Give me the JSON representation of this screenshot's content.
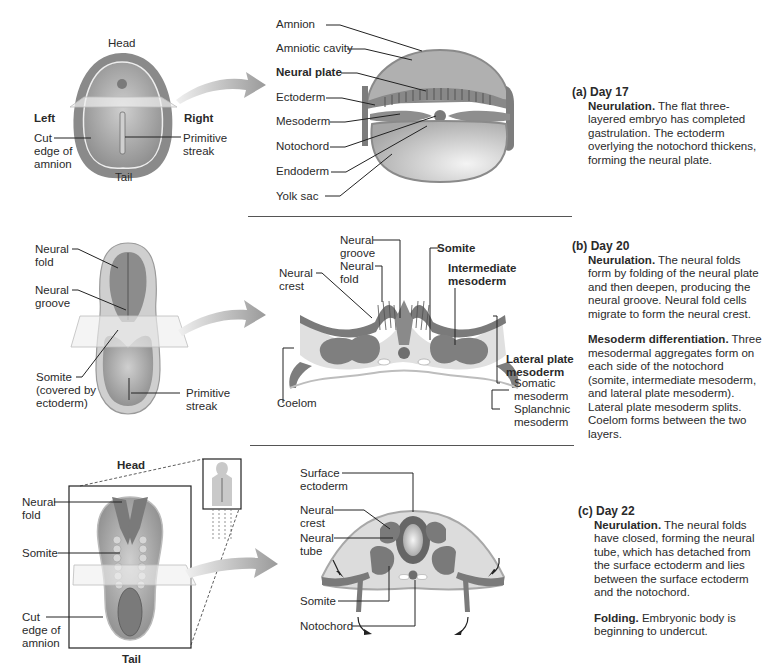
{
  "panels": [
    {
      "id": "a",
      "letter": "(a)",
      "day": "Day 17",
      "paragraphs": [
        {
          "lead": "Neurulation.",
          "text": " The flat three-layered embryo has completed gastrulation. The ectoderm overlying the notochord thickens, forming the neural plate."
        }
      ],
      "embryo_labels": {
        "head": "Head",
        "tail": "Tail",
        "left": "Left",
        "right": "Right",
        "cut_edge": "Cut\nedge of\namnion",
        "primitive_streak": "Primitive\nstreak"
      },
      "section_labels": [
        "Amnion",
        "Amniotic cavity",
        "Neural plate",
        "Ectoderm",
        "Mesoderm",
        "Notochord",
        "Endoderm",
        "Yolk sac"
      ]
    },
    {
      "id": "b",
      "letter": "(b)",
      "day": "Day 20",
      "paragraphs": [
        {
          "lead": "Neurulation.",
          "text": " The neural folds form by folding of the neural plate and then deepen, producing the neural groove. Neural fold cells migrate to form the neural crest."
        },
        {
          "lead": "Mesoderm differentiation.",
          "text": " Three mesodermal aggregates form on each side of the notochord (somite, intermediate mesoderm, and lateral plate mesoderm). Lateral plate mesoderm splits. Coelom forms between the two layers."
        }
      ],
      "embryo_labels": {
        "neural_fold": "Neural\nfold",
        "neural_groove": "Neural\ngroove",
        "somite": "Somite\n(covered by\nectoderm)",
        "primitive_streak": "Primitive\nstreak"
      },
      "section_labels": {
        "neural_groove": "Neural\ngroove",
        "neural_fold": "Neural\nfold",
        "neural_crest": "Neural\ncrest",
        "somite": "Somite",
        "intermediate_mesoderm": "Intermediate\nmesoderm",
        "lateral_plate_mesoderm": "Lateral plate\nmesoderm",
        "somatic_mesoderm": "Somatic\nmesoderm",
        "splanchnic_mesoderm": "Splanchnic\nmesoderm",
        "coelom": "Coelom"
      }
    },
    {
      "id": "c",
      "letter": "(c)",
      "day": "Day 22",
      "paragraphs": [
        {
          "lead": "Neurulation.",
          "text": " The neural folds have closed, forming the neural tube, which has detached from the surface ectoderm and lies between the surface ectoderm and the notochord."
        },
        {
          "lead": "Folding.",
          "text": " Embryonic body is beginning to undercut."
        }
      ],
      "embryo_labels": {
        "head": "Head",
        "tail": "Tail",
        "neural_fold": "Neural\nfold",
        "somite": "Somite",
        "cut_edge": "Cut\nedge of\namnion"
      },
      "section_labels": {
        "surface_ectoderm": "Surface\nectoderm",
        "neural_crest": "Neural\ncrest",
        "neural_tube": "Neural\ntube",
        "somite": "Somite",
        "notochord": "Notochord"
      }
    }
  ],
  "colors": {
    "tissue_dark": "#7d7d7d",
    "tissue_mid": "#a9a9a9",
    "tissue_light": "#d4d4d4",
    "fill_pale": "#e4e4e4",
    "arrow": "#b8b8b8",
    "line": "#222222"
  }
}
